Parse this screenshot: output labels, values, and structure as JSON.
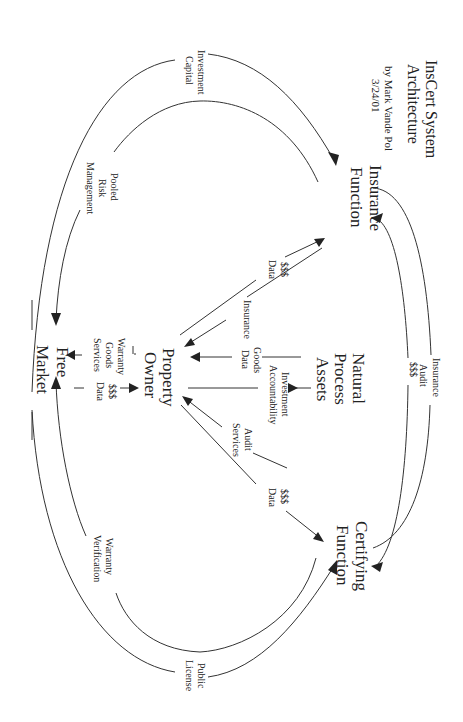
{
  "diagram": {
    "title_line1": "InsCert System",
    "title_line2": "Architecture",
    "author": "by Mark Vande Pol",
    "date": "3/24/01",
    "orientation": "rotated 90deg clockwise",
    "nodes": {
      "insurance_function": {
        "line1": "Insurance",
        "line2": "Function"
      },
      "certifying_function": {
        "line1": "Certifying",
        "line2": "Function"
      },
      "natural_process_assets": {
        "line1": "Natural",
        "line2": "Process",
        "line3": "Assets"
      },
      "property_owner": {
        "line1": "Property",
        "line2": "Owner"
      },
      "free_market": {
        "line1": "Free",
        "line2": "Market"
      }
    },
    "flows": {
      "investment_capital": {
        "line1": "Investment",
        "line2": "Capital"
      },
      "pooled_risk_management": {
        "line1": "Pooled",
        "line2": "Risk",
        "line3": "Management"
      },
      "insurance_audit": {
        "line1": "Insurance",
        "line2": "Audit"
      },
      "ins_cert_money": {
        "line1": "$$$"
      },
      "owner_to_insurance": {
        "line1": "$$$",
        "line2": "Data"
      },
      "insurance_to_owner": {
        "line1": "Insurance"
      },
      "goods_data": {
        "line1": "Goods",
        "line2": "Data"
      },
      "investment_accountability": {
        "line1": "Investment",
        "line2": "Accountability"
      },
      "audit_services": {
        "line1": "Audit",
        "line2": "Services"
      },
      "owner_to_certifying": {
        "line1": "$$$",
        "line2": "Data"
      },
      "owner_to_market": {
        "line1": "Warranty",
        "line2": "Goods",
        "line3": "Services"
      },
      "market_to_owner": {
        "line1": "$$$",
        "line2": "Data"
      },
      "warranty_verification": {
        "line1": "Warranty",
        "line2": "Verification"
      },
      "public_license": {
        "line1": "Public",
        "line2": "License"
      }
    }
  }
}
